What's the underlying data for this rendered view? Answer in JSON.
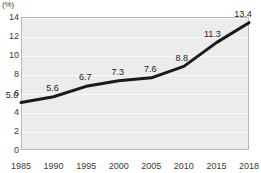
{
  "chart_data": {
    "type": "line",
    "title": "",
    "subtitle": "",
    "xlabel": "",
    "ylabel": "",
    "unit_label": "(%)",
    "categories": [
      "1985",
      "1990",
      "1995",
      "2000",
      "2005",
      "2010",
      "2015",
      "2018"
    ],
    "values": [
      5.0,
      5.6,
      6.7,
      7.3,
      7.6,
      8.8,
      11.3,
      13.4
    ],
    "point_labels": [
      "5.0",
      "5.6",
      "6.7",
      "7.3",
      "7.6",
      "8.8",
      "11.3",
      "13.4"
    ],
    "series": [
      {
        "name": "",
        "values": [
          5.0,
          5.6,
          6.7,
          7.3,
          7.6,
          8.8,
          11.3,
          13.4
        ],
        "color": "#1a1a1a"
      }
    ],
    "ylim": [
      0,
      14
    ],
    "yticks": [
      0,
      2,
      4,
      6,
      8,
      10,
      12,
      14
    ],
    "ytick_labels": [
      "0",
      "2",
      "4",
      "6",
      "8",
      "10",
      "12",
      "14"
    ],
    "xtick_labels": [
      "1985",
      "1990",
      "1995",
      "2000",
      "2005",
      "2010",
      "2015",
      "2018"
    ],
    "grid": true,
    "grid_color": "#fbfbfb",
    "legend": false,
    "legend_position": "none",
    "plot_background": "#ececec",
    "plot_border_color": "#b9b9b9",
    "line_color": "#1a1a1a",
    "line_width": 3,
    "markers": false,
    "data_labels_visible": true
  }
}
